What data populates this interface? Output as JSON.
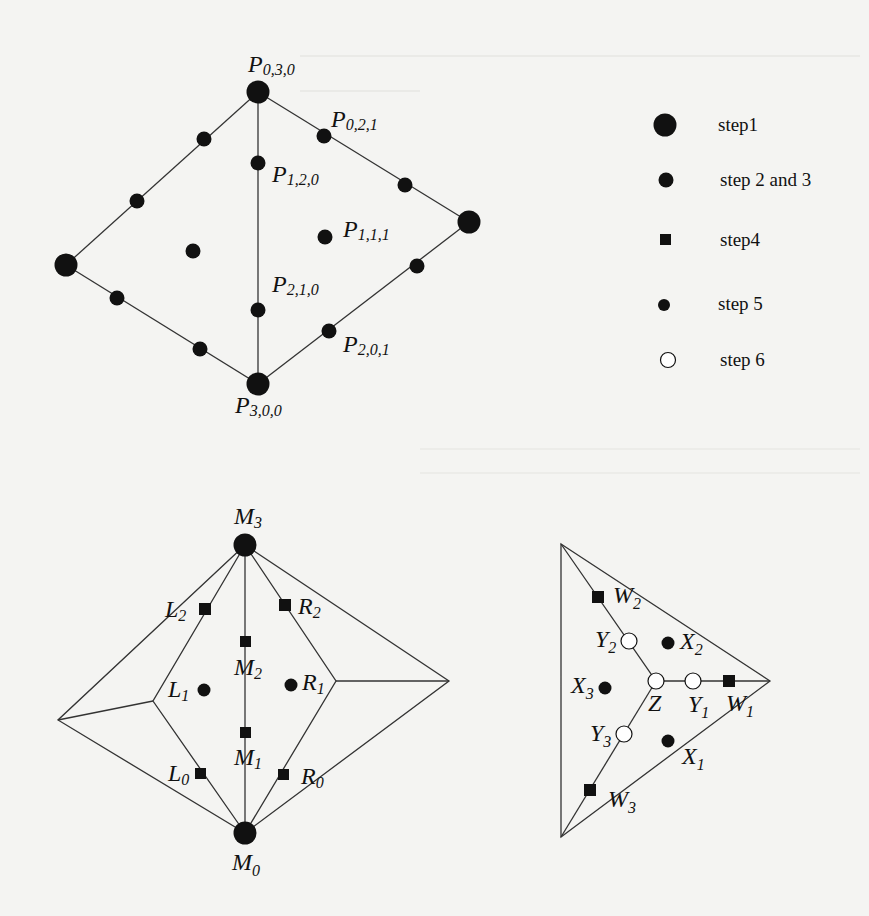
{
  "figure": {
    "top_diagram": {
      "title": "cubic triangular patch control points",
      "labels": {
        "p030": {
          "base": "P",
          "sub": "0,3,0"
        },
        "p021": {
          "base": "P",
          "sub": "0,2,1"
        },
        "p120": {
          "base": "P",
          "sub": "1,2,0"
        },
        "p111": {
          "base": "P",
          "sub": "1,1,1"
        },
        "p210": {
          "base": "P",
          "sub": "2,1,0"
        },
        "p201": {
          "base": "P",
          "sub": "2,0,1"
        },
        "p300": {
          "base": "P",
          "sub": "3,0,0"
        }
      }
    },
    "legend": {
      "items": [
        {
          "marker": "large-filled-circle",
          "label": "step1"
        },
        {
          "marker": "filled-circle",
          "label": "step 2 and 3"
        },
        {
          "marker": "filled-square",
          "label": "step4"
        },
        {
          "marker": "small-filled-circle",
          "label": "step 5"
        },
        {
          "marker": "open-circle",
          "label": "step 6"
        }
      ]
    },
    "bottom_left_diagram": {
      "labels": {
        "M3": {
          "base": "M",
          "sub": "3"
        },
        "L2": {
          "base": "L",
          "sub": "2"
        },
        "R2": {
          "base": "R",
          "sub": "2"
        },
        "M2": {
          "base": "M",
          "sub": "2"
        },
        "L1": {
          "base": "L",
          "sub": "1"
        },
        "R1": {
          "base": "R",
          "sub": "1"
        },
        "M1": {
          "base": "M",
          "sub": "1"
        },
        "L0": {
          "base": "L",
          "sub": "0"
        },
        "R0": {
          "base": "R",
          "sub": "0"
        },
        "M0": {
          "base": "M",
          "sub": "0"
        }
      }
    },
    "bottom_right_diagram": {
      "labels": {
        "W2": {
          "base": "W",
          "sub": "2"
        },
        "Y2": {
          "base": "Y",
          "sub": "2"
        },
        "X2": {
          "base": "X",
          "sub": "2"
        },
        "X3": {
          "base": "X",
          "sub": "3"
        },
        "Z": {
          "base": "Z",
          "sub": ""
        },
        "Y1": {
          "base": "Y",
          "sub": "1"
        },
        "W1": {
          "base": "W",
          "sub": "1"
        },
        "Y3": {
          "base": "Y",
          "sub": "3"
        },
        "X1": {
          "base": "X",
          "sub": "1"
        },
        "W3": {
          "base": "W",
          "sub": "3"
        }
      }
    },
    "colors": {
      "background": "#f4f4f2",
      "ink": "#111111",
      "line": "#333333"
    }
  }
}
